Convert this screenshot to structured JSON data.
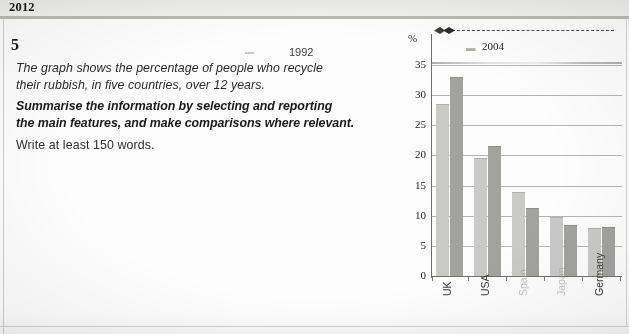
{
  "header": {
    "year": "2012"
  },
  "task": {
    "number": "5",
    "prompt_line_1": "The graph shows the percentage of people who recycle",
    "prompt_line_2": "their rubbish, in five countries,  over 12 years.",
    "instruction_line_1": "Summarise the information by selecting and reporting",
    "instruction_line_2": "the main features, and make comparisons where relevant.",
    "word_count_line": "Write at least 150 words."
  },
  "stray_legend": {
    "label_1992": "1992"
  },
  "chart_data": {
    "type": "bar",
    "title": "",
    "xlabel": "",
    "ylabel": "%",
    "ylim": [
      0,
      35
    ],
    "yticks": [
      "0",
      "5",
      "10",
      "15",
      "20",
      "25",
      "30",
      "35"
    ],
    "grid": true,
    "legend_position": "top",
    "legend_entries": [
      "1992",
      "2004"
    ],
    "categories": [
      "UK",
      "USA",
      "Spain",
      "Japan",
      "Germany"
    ],
    "series": [
      {
        "name": "1992",
        "color": "#c9c9c7",
        "values": [
          28.5,
          19.5,
          14.0,
          9.8,
          8.0
        ]
      },
      {
        "name": "2004",
        "color": "#a2a29f",
        "values": [
          33.0,
          21.5,
          11.3,
          8.5,
          8.2
        ]
      }
    ]
  }
}
